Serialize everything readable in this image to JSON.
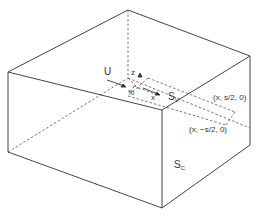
{
  "diagram": {
    "colors": {
      "line": "#444444",
      "background": "#ffffff"
    },
    "labels": {
      "U": "U",
      "z": "z",
      "x": "x",
      "y_small": "y",
      "s0": "s",
      "s0_sub": "0",
      "Sv": "S",
      "Sv_sub": "V",
      "Sc": "S",
      "Sc_sub": "C",
      "point_plus": "(x, s/2, 0)",
      "point_minus": "(x, −s/2, 0)"
    }
  }
}
